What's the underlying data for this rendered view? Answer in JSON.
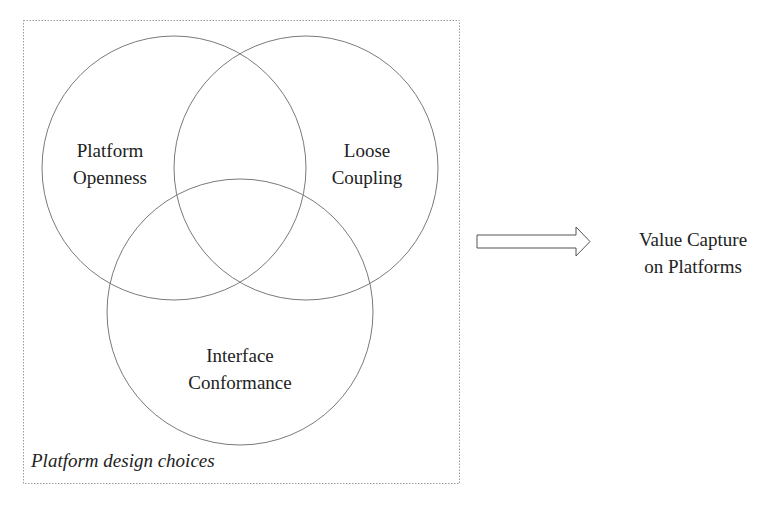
{
  "diagram": {
    "group_box": {
      "caption": "Platform design choices",
      "border_color": "#9a9a9a",
      "border_style": "dotted"
    },
    "circles": [
      {
        "id": "platform-openness",
        "line1": "Platform",
        "line2": "Openness"
      },
      {
        "id": "loose-coupling",
        "line1": "Loose",
        "line2": "Coupling"
      },
      {
        "id": "interface-conformance",
        "line1": "Interface",
        "line2": "Conformance"
      }
    ],
    "arrow": {
      "direction": "right",
      "style": "outlined block arrow"
    },
    "outcome": {
      "line1": "Value Capture",
      "line2": "on Platforms"
    },
    "colors": {
      "circle_stroke": "#777777",
      "text": "#222222",
      "background": "#ffffff"
    }
  }
}
